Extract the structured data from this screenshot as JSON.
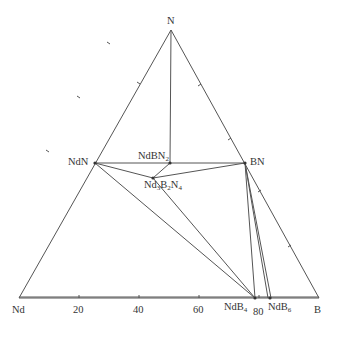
{
  "diagram": {
    "type": "ternary phase diagram",
    "vertices": {
      "top": {
        "label": "N"
      },
      "left": {
        "label": "Nd"
      },
      "right": {
        "label": "B"
      }
    },
    "bottom_axis_ticks": [
      "20",
      "40",
      "60",
      "80"
    ],
    "phases": [
      {
        "id": "NdN",
        "label": "NdN"
      },
      {
        "id": "BN",
        "label": "BN"
      },
      {
        "id": "NdBN2",
        "label_main": "NdBN",
        "label_sub": "2"
      },
      {
        "id": "Nd3B2N4",
        "parts": [
          "Nd",
          "3",
          "B",
          "2",
          "N",
          "4"
        ]
      },
      {
        "id": "NdB4",
        "label_main": "NdB",
        "label_sub": "4"
      },
      {
        "id": "NdB6",
        "label_main": "NdB",
        "label_sub": "6"
      }
    ],
    "tie_lines": [
      [
        "NdN",
        "BN"
      ],
      [
        "N",
        "NdBN2"
      ],
      [
        "NdN",
        "Nd3B2N4"
      ],
      [
        "Nd3B2N4",
        "BN"
      ],
      [
        "Nd3B2N4",
        "NdBN2"
      ],
      [
        "NdN",
        "NdB4"
      ],
      [
        "Nd3B2N4",
        "NdB4"
      ],
      [
        "BN",
        "NdB4"
      ],
      [
        "BN",
        "NdB6"
      ],
      [
        "BN",
        "B"
      ]
    ],
    "colors": {
      "line": "#555555",
      "text": "#333333"
    }
  }
}
